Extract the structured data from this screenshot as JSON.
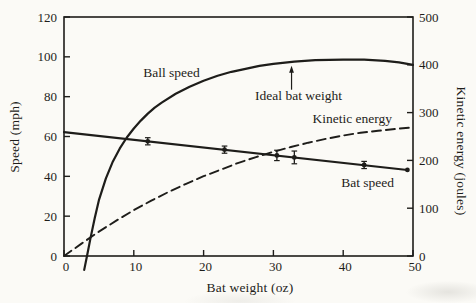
{
  "figure": {
    "background": "#fbfaf6",
    "ink": "#1e1d1a"
  },
  "chart_data": {
    "type": "line",
    "title": "",
    "xlabel": "Bat weight (oz)",
    "ylabel_left": "Speed (mph)",
    "ylabel_right": "Kinetic energy (joules)",
    "x_range": [
      0,
      50
    ],
    "y_left_range": [
      0,
      120
    ],
    "y_right_range": [
      0,
      500
    ],
    "x_ticks": [
      0,
      10,
      20,
      30,
      40,
      50
    ],
    "y_left_ticks": [
      0,
      20,
      40,
      60,
      80,
      100,
      120
    ],
    "y_right_ticks": [
      0,
      100,
      200,
      300,
      400,
      500
    ],
    "grid": false,
    "legend": "inline-labels",
    "series": [
      {
        "name": "Ball speed",
        "axis": "left",
        "style": "solid",
        "x": [
          2.9,
          3.3,
          3.8,
          4.4,
          5,
          6,
          7,
          8,
          9,
          10,
          11,
          12,
          13,
          14,
          16,
          18,
          20,
          22,
          24,
          26,
          28,
          30,
          33,
          36,
          40,
          43,
          46,
          48,
          50
        ],
        "y": [
          -7,
          0,
          9,
          19,
          28,
          39,
          47.5,
          54,
          59.5,
          64,
          68,
          71.5,
          74.5,
          77,
          81.5,
          85,
          88,
          90.5,
          92.5,
          94,
          95.5,
          96.5,
          97.6,
          98.3,
          98.6,
          98.6,
          98,
          97.2,
          96
        ]
      },
      {
        "name": "Bat speed",
        "axis": "left",
        "style": "solid",
        "x": [
          0,
          49.2
        ],
        "y": [
          62.2,
          43.2
        ]
      },
      {
        "name": "Kinetic energy",
        "axis": "right",
        "style": "dashed",
        "x": [
          0,
          2.5,
          5,
          7.5,
          10,
          12.5,
          15,
          17.5,
          20,
          22.5,
          25,
          27.5,
          30,
          32.5,
          35,
          37.5,
          40,
          42.5,
          45,
          47.5,
          50
        ],
        "y": [
          0,
          26,
          51,
          74,
          96,
          116,
          134,
          151,
          167,
          181,
          195,
          207,
          218,
          228,
          237,
          245,
          252,
          258,
          262,
          266,
          269
        ]
      }
    ],
    "measured_points": {
      "series": "Bat speed",
      "axis": "left",
      "points": [
        {
          "x": 12,
          "y": 57.6,
          "err": 1.8
        },
        {
          "x": 23,
          "y": 53.4,
          "err": 1.8
        },
        {
          "x": 30.5,
          "y": 50.5,
          "err": 2.6
        },
        {
          "x": 33,
          "y": 49.5,
          "err": 3.2
        },
        {
          "x": 43,
          "y": 45.7,
          "err": 1.8
        },
        {
          "x": 49.2,
          "y": 43.2,
          "err": 0
        }
      ]
    },
    "annotations": [
      {
        "id": "ball-speed-label",
        "text": "Ball speed",
        "axis": "left",
        "x": 15.4,
        "y": 92
      },
      {
        "id": "ideal-bat-weight-label",
        "text": "Ideal bat weight",
        "axis": "left",
        "x": 33.6,
        "y": 80.5,
        "arrow": {
          "x": 32.6,
          "from_y": 83.5,
          "to_y": 95.5
        }
      },
      {
        "id": "kinetic-energy-label",
        "text": "Kinetic energy",
        "axis": "right",
        "x": 41.3,
        "y": 287
      },
      {
        "id": "bat-speed-label",
        "text": "Bat speed",
        "axis": "left",
        "x": 43.5,
        "y": 37
      }
    ]
  }
}
